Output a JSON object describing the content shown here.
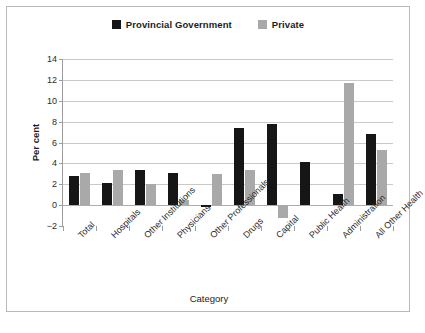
{
  "chart_data": {
    "type": "bar",
    "title": "",
    "xlabel": "Category",
    "ylabel": "Per cent",
    "ylim": [
      -2,
      14
    ],
    "yticks": [
      -2,
      0,
      2,
      4,
      6,
      8,
      10,
      12,
      14
    ],
    "ytick_labels": [
      "−2",
      "0",
      "2",
      "4",
      "6",
      "8",
      "10",
      "12",
      "14"
    ],
    "grid": "horizontal",
    "legend_position": "top-center",
    "categories": [
      "Total",
      "Hospitals",
      "Other Institutions",
      "Physicians",
      "Other Professionals",
      "Drugs",
      "Capital",
      "Public Health",
      "Administration",
      "All Other Health"
    ],
    "series": [
      {
        "name": "Provincial Government",
        "color": "#161616",
        "values": [
          2.8,
          2.1,
          3.4,
          3.1,
          -0.2,
          7.4,
          7.8,
          4.1,
          1.05,
          6.85
        ]
      },
      {
        "name": "Private",
        "color": "#a9a9a9",
        "values": [
          3.1,
          3.35,
          2.0,
          0.45,
          2.95,
          3.35,
          -1.2,
          0,
          11.7,
          5.25
        ]
      }
    ]
  },
  "colors": {
    "provincial_government": "#161616",
    "private": "#a9a9a9",
    "gridline": "#c9c9c9",
    "axis": "#9d9d9d",
    "frame": "#b9b9b9",
    "background": "#ffffff"
  }
}
